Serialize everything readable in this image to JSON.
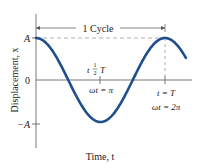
{
  "chart_data": {
    "type": "line",
    "title": "",
    "xlabel": "Time, t",
    "ylabel": "Displacement, x",
    "y_ticks": [
      "A",
      "0",
      "-A"
    ],
    "annotations": {
      "cycle": "1 Cycle",
      "half_period_t": "t = 1/2 T",
      "half_period_wt": "ωt = π",
      "period_t": "t = T",
      "period_wt": "ωt = 2π"
    },
    "series": [
      {
        "name": "x = A cos(ωt)",
        "color": "#1f4e8c",
        "function": "A*cos(wt)",
        "x_range_wt": [
          0,
          7.3
        ]
      }
    ],
    "grid": false
  },
  "labels": {
    "xlabel": "Time, t",
    "ylabel": "Displacement, x",
    "tick_A": "A",
    "tick_0": "0",
    "tick_negA": "−A",
    "cycle": "1 Cycle",
    "half_t_prefix": "t",
    "half_num": "1",
    "half_den": "2",
    "half_T": "T",
    "half_wt": "ωt = π",
    "period_t": "t = T",
    "period_wt": "ωt = 2π"
  }
}
